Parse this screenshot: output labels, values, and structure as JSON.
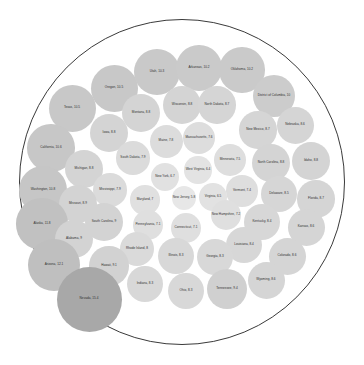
{
  "chart_data": {
    "type": "bubble",
    "subtype": "circle-packing",
    "title": "",
    "subtitle": "",
    "xlabel": "",
    "ylabel": "",
    "legend": [],
    "grid": false,
    "value_unit": "",
    "label_format": "{name}, {value}",
    "root": {
      "stroke": "#3a3a3a",
      "fill": "#ffffff"
    },
    "color_scale": {
      "type": "sequential",
      "min_value": 5.8,
      "max_value": 15.4,
      "low_color": "#e0e0e0",
      "high_color": "#8a8a8a"
    },
    "categories": [
      "Nevada",
      "Arizona",
      "Alaska",
      "Washington",
      "California",
      "Texas",
      "Oregon",
      "Utah",
      "Arkansas",
      "Oklahoma",
      "District of Columbia",
      "Tennessee",
      "Hawaii",
      "Alabama",
      "South Carolina",
      "Missouri",
      "Michigan",
      "Iowa",
      "Wisconsin",
      "North Carolina",
      "Idaho",
      "Montana",
      "North Dakota",
      "New Mexico",
      "Nebraska",
      "Colorado",
      "Wyoming",
      "Kansas",
      "Florida",
      "Delaware",
      "Kentucky",
      "Louisiana",
      "Illinois",
      "Georgia",
      "Indiana",
      "Ohio",
      "Rhode Island",
      "Mississippi",
      "South Dakota",
      "Maine",
      "Massachusetts",
      "Minnesota",
      "Vermont",
      "New Hampshire",
      "Connecticut",
      "Pennsylvania",
      "Maryland",
      "New York",
      "Virginia",
      "West Virginia",
      "New Jersey"
    ],
    "values": [
      15.4,
      12.1,
      11.8,
      10.8,
      10.6,
      10.5,
      10.5,
      10.3,
      10.2,
      10.2,
      10,
      9.4,
      9.1,
      9,
      9,
      8.9,
      8.8,
      8.8,
      8.8,
      8.8,
      8.8,
      8.8,
      8.7,
      8.7,
      8.6,
      8.6,
      8.6,
      8.6,
      8.7,
      8.5,
      8.4,
      8.4,
      8.3,
      8.3,
      8.3,
      8.3,
      8,
      7.9,
      7.9,
      7.8,
      7.6,
      7.5,
      7.4,
      7.2,
      7.1,
      7.1,
      7,
      6.7,
      6.5,
      6.4,
      5.8
    ],
    "nodes": [
      {
        "name": "Texas",
        "value": 10.5,
        "label": "Texas, 10.5",
        "cx": 72,
        "cy": 108,
        "r": 23.5,
        "fill": "#c8c8c8"
      },
      {
        "name": "Oregon",
        "value": 10.5,
        "label": "Oregon, 10.5",
        "cx": 114,
        "cy": 88,
        "r": 23.5,
        "fill": "#c8c8c8"
      },
      {
        "name": "Utah",
        "value": 10.3,
        "label": "Utah, 10.3",
        "cx": 157,
        "cy": 72,
        "r": 22.9,
        "fill": "#c9c9c9"
      },
      {
        "name": "Arkansas",
        "value": 10.2,
        "label": "Arkansas, 10.2",
        "cx": 199,
        "cy": 68,
        "r": 22.7,
        "fill": "#cacaca"
      },
      {
        "name": "Oklahoma",
        "value": 10.2,
        "label": "Oklahoma, 10.2",
        "cx": 242,
        "cy": 70,
        "r": 22.7,
        "fill": "#cacaca"
      },
      {
        "name": "District of Columbia",
        "value": 10,
        "label": "District of Columbia, 10",
        "cx": 274,
        "cy": 96,
        "r": 21.0,
        "fill": "#cccccc"
      },
      {
        "name": "California",
        "value": 10.6,
        "label": "California, 10.6",
        "cx": 51,
        "cy": 148,
        "r": 23.8,
        "fill": "#c7c7c7"
      },
      {
        "name": "Montana",
        "value": 8.8,
        "label": "Montana, 8.8",
        "cx": 141,
        "cy": 113,
        "r": 19.0,
        "fill": "#d4d4d4"
      },
      {
        "name": "Wisconsin",
        "value": 8.8,
        "label": "Wisconsin, 8.8",
        "cx": 182,
        "cy": 105,
        "r": 19.0,
        "fill": "#d4d4d4"
      },
      {
        "name": "North Dakota",
        "value": 8.7,
        "label": "North Dakota, 8.7",
        "cx": 217,
        "cy": 105,
        "r": 18.7,
        "fill": "#d5d5d5"
      },
      {
        "name": "New Mexico",
        "value": 8.7,
        "label": "New Mexico, 8.7",
        "cx": 258,
        "cy": 130,
        "r": 18.7,
        "fill": "#d5d5d5"
      },
      {
        "name": "Nebraska",
        "value": 8.6,
        "label": "Nebraska, 8.6",
        "cx": 295,
        "cy": 125,
        "r": 18.5,
        "fill": "#d5d5d5"
      },
      {
        "name": "Iowa",
        "value": 8.8,
        "label": "Iowa, 8.8",
        "cx": 109,
        "cy": 133,
        "r": 19.0,
        "fill": "#d4d4d4"
      },
      {
        "name": "Maine",
        "value": 7.8,
        "label": "Maine, 7.8",
        "cx": 166,
        "cy": 141,
        "r": 16.5,
        "fill": "#dcdcdc"
      },
      {
        "name": "Massachusetts",
        "value": 7.6,
        "label": "Massachusetts, 7.6",
        "cx": 199,
        "cy": 138,
        "r": 16.1,
        "fill": "#dddddd"
      },
      {
        "name": "Michigan",
        "value": 8.8,
        "label": "Michigan, 8.8",
        "cx": 84,
        "cy": 169,
        "r": 19.0,
        "fill": "#d4d4d4"
      },
      {
        "name": "South Dakota",
        "value": 7.9,
        "label": "South Dakota, 7.9",
        "cx": 133,
        "cy": 158,
        "r": 16.8,
        "fill": "#dbdbdb"
      },
      {
        "name": "Minnesota",
        "value": 7.5,
        "label": "Minnesota, 7.5",
        "cx": 230,
        "cy": 160,
        "r": 15.9,
        "fill": "#dedede"
      },
      {
        "name": "North Carolina",
        "value": 8.8,
        "label": "North Carolina, 8.8",
        "cx": 271,
        "cy": 163,
        "r": 19.0,
        "fill": "#d4d4d4"
      },
      {
        "name": "Idaho",
        "value": 8.8,
        "label": "Idaho, 8.8",
        "cx": 311,
        "cy": 161,
        "r": 19.0,
        "fill": "#d4d4d4"
      },
      {
        "name": "West Virginia",
        "value": 6.4,
        "label": "West Virginia, 6.4",
        "cx": 198,
        "cy": 170,
        "r": 13.6,
        "fill": "#e3e3e3"
      },
      {
        "name": "New York",
        "value": 6.7,
        "label": "New York, 6.7",
        "cx": 165,
        "cy": 177,
        "r": 14.2,
        "fill": "#e1e1e1"
      },
      {
        "name": "Washington",
        "value": 10.8,
        "label": "Washington, 10.8",
        "cx": 43,
        "cy": 190,
        "r": 24.1,
        "fill": "#c6c6c6"
      },
      {
        "name": "Mississippi",
        "value": 7.9,
        "label": "Mississippi, 7.9",
        "cx": 110,
        "cy": 190,
        "r": 16.8,
        "fill": "#dbdbdb"
      },
      {
        "name": "Vermont",
        "value": 7.4,
        "label": "Vermont, 7.4",
        "cx": 242,
        "cy": 191,
        "r": 15.7,
        "fill": "#dedede"
      },
      {
        "name": "Delaware",
        "value": 8.5,
        "label": "Delaware, 8.5",
        "cx": 279,
        "cy": 194,
        "r": 18.3,
        "fill": "#d6d6d6"
      },
      {
        "name": "Florida",
        "value": 8.7,
        "label": "Florida, 8.7",
        "cx": 316,
        "cy": 199,
        "r": 18.7,
        "fill": "#d5d5d5"
      },
      {
        "name": "Missouri",
        "value": 8.9,
        "label": "Missouri, 8.9",
        "cx": 78,
        "cy": 204,
        "r": 19.2,
        "fill": "#d3d3d3"
      },
      {
        "name": "Maryland",
        "value": 7,
        "label": "Maryland, 7",
        "cx": 145,
        "cy": 200,
        "r": 14.8,
        "fill": "#e0e0e0"
      },
      {
        "name": "New Jersey",
        "value": 5.8,
        "label": "New Jersey, 5.8",
        "cx": 184,
        "cy": 198,
        "r": 12.4,
        "fill": "#e7e7e7"
      },
      {
        "name": "Virginia",
        "value": 6.5,
        "label": "Virginia, 6.5",
        "cx": 213,
        "cy": 197,
        "r": 13.8,
        "fill": "#e2e2e2"
      },
      {
        "name": "Alaska",
        "value": 11.8,
        "label": "Alaska, 11.8",
        "cx": 42,
        "cy": 224,
        "r": 25.6,
        "fill": "#c1c1c1"
      },
      {
        "name": "South Carolina",
        "value": 9,
        "label": "South Carolina, 9",
        "cx": 104,
        "cy": 222,
        "r": 19.4,
        "fill": "#d3d3d3"
      },
      {
        "name": "Pennsylvania",
        "value": 7.1,
        "label": "Pennsylvania, 7.1",
        "cx": 148,
        "cy": 225,
        "r": 15.0,
        "fill": "#dfdfdf"
      },
      {
        "name": "Connecticut",
        "value": 7.1,
        "label": "Connecticut, 7.1",
        "cx": 186,
        "cy": 228,
        "r": 15.0,
        "fill": "#dfdfdf"
      },
      {
        "name": "New Hampshire",
        "value": 7.2,
        "label": "New Hampshire, 7.2",
        "cx": 226,
        "cy": 215,
        "r": 15.3,
        "fill": "#dfdfdf"
      },
      {
        "name": "Kentucky",
        "value": 8.4,
        "label": "Kentucky, 8.4",
        "cx": 262,
        "cy": 222,
        "r": 18.1,
        "fill": "#d7d7d7"
      },
      {
        "name": "Kansas",
        "value": 8.6,
        "label": "Kansas, 8.6",
        "cx": 306,
        "cy": 227,
        "r": 18.5,
        "fill": "#d5d5d5"
      },
      {
        "name": "Alabama",
        "value": 9,
        "label": "Alabama, 9",
        "cx": 74,
        "cy": 239,
        "r": 19.4,
        "fill": "#d3d3d3"
      },
      {
        "name": "Rhode Island",
        "value": 8,
        "label": "Rhode Island, 8",
        "cx": 137,
        "cy": 249,
        "r": 17.0,
        "fill": "#dadada"
      },
      {
        "name": "Louisiana",
        "value": 8.4,
        "label": "Louisiana, 8.4",
        "cx": 244,
        "cy": 245,
        "r": 18.1,
        "fill": "#d7d7d7"
      },
      {
        "name": "Arizona",
        "value": 12.1,
        "label": "Arizona, 12.1",
        "cx": 54,
        "cy": 265,
        "r": 26.1,
        "fill": "#bfbfbf"
      },
      {
        "name": "Hawaii",
        "value": 9.1,
        "label": "Hawaii, 9.1",
        "cx": 109,
        "cy": 266,
        "r": 19.7,
        "fill": "#d2d2d2"
      },
      {
        "name": "Illinois",
        "value": 8.3,
        "label": "Illinois, 8.3",
        "cx": 176,
        "cy": 256,
        "r": 17.9,
        "fill": "#d8d8d8"
      },
      {
        "name": "Georgia",
        "value": 8.3,
        "label": "Georgia, 8.3",
        "cx": 215,
        "cy": 257,
        "r": 17.9,
        "fill": "#d8d8d8"
      },
      {
        "name": "Colorado",
        "value": 8.6,
        "label": "Colorado, 8.6",
        "cx": 287,
        "cy": 256,
        "r": 18.5,
        "fill": "#d5d5d5"
      },
      {
        "name": "Indiana",
        "value": 8.3,
        "label": "Indiana, 8.3",
        "cx": 145,
        "cy": 284,
        "r": 17.9,
        "fill": "#d8d8d8"
      },
      {
        "name": "Ohio",
        "value": 8.3,
        "label": "Ohio, 8.3",
        "cx": 186,
        "cy": 291,
        "r": 17.9,
        "fill": "#d8d8d8"
      },
      {
        "name": "Tennessee",
        "value": 9.4,
        "label": "Tennessee, 9.4",
        "cx": 227,
        "cy": 289,
        "r": 20.3,
        "fill": "#d0d0d0"
      },
      {
        "name": "Wyoming",
        "value": 8.6,
        "label": "Wyoming, 8.6",
        "cx": 266,
        "cy": 280,
        "r": 18.5,
        "fill": "#d5d5d5"
      },
      {
        "name": "Nevada",
        "value": 15.4,
        "label": "Nevada, 15.4",
        "cx": 89,
        "cy": 299,
        "r": 32.5,
        "fill": "#a8a8a8"
      }
    ]
  },
  "root_circle": {
    "cx": 182,
    "cy": 182,
    "r": 163
  }
}
